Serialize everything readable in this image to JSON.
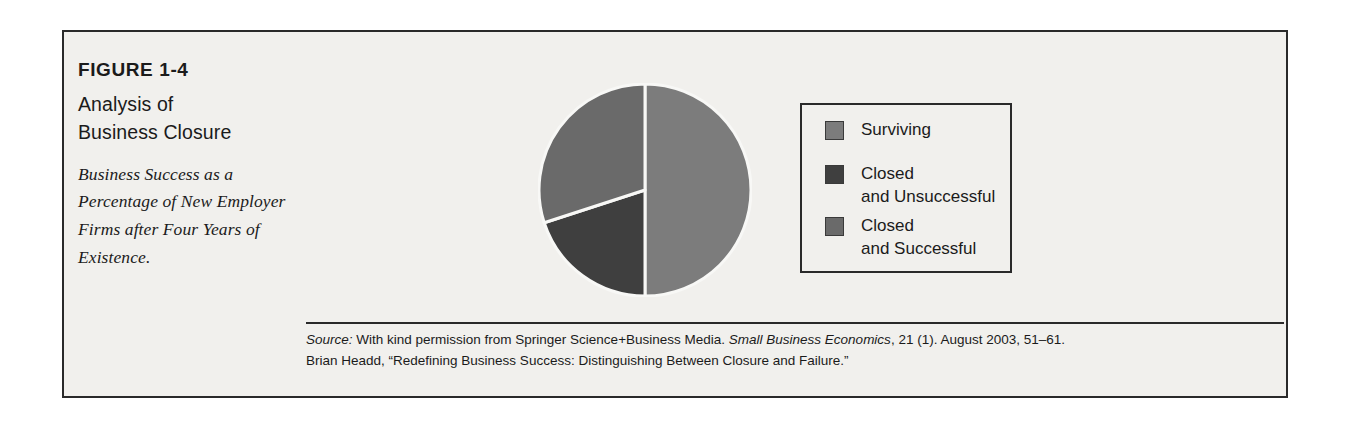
{
  "figure": {
    "number": "FIGURE 1-4",
    "title_lines": [
      "Analysis of",
      "Business Closure"
    ],
    "subtitle": "Business Success as a Percentage of New Employer Firms after Four Years of Existence."
  },
  "legend": {
    "items": [
      {
        "label": "Surviving",
        "color": "#7c7c7c",
        "swatch_name": "legend-swatch-surviving"
      },
      {
        "label": "Closed\nand Unsuccessful",
        "color": "#3f3f3f",
        "swatch_name": "legend-swatch-closed-unsuccessful"
      },
      {
        "label": "Closed\nand Successful",
        "color": "#6a6a6a",
        "swatch_name": "legend-swatch-closed-successful"
      }
    ]
  },
  "source": {
    "prefix": "Source:",
    "line1_a": " With kind permission from Springer Science+Business Media. ",
    "line1_italic": "Small Business Economics",
    "line1_b": ", 21 (1). August 2003, 51–61.",
    "line2": "Brian Headd, “Redefining Business Success: Distinguishing Between Closure and Failure.”"
  },
  "colors": {
    "page_background": "#ffffff",
    "panel_background": "#f1f0ed",
    "frame_border": "#2a2a2a",
    "text": "#1b1b1b",
    "wedge_divider": "#f8f8f6"
  },
  "chart_data": {
    "type": "pie",
    "title": "Analysis of Business Closure",
    "subtitle": "Business Success as a Percentage of New Employer Firms after Four Years of Existence.",
    "unit": "percent",
    "start_angle_deg": 0,
    "direction": "clockwise",
    "categories": [
      "Surviving",
      "Closed and Unsuccessful",
      "Closed and Successful"
    ],
    "values": [
      50,
      20,
      30
    ],
    "colors": [
      "#7c7c7c",
      "#3f3f3f",
      "#6a6a6a"
    ],
    "legend_position": "right",
    "grid": false,
    "slices": [
      {
        "label": "Surviving",
        "value": 50,
        "color": "#7c7c7c",
        "start_deg": 0,
        "end_deg": 180
      },
      {
        "label": "Closed and Unsuccessful",
        "value": 20,
        "color": "#3f3f3f",
        "start_deg": 180,
        "end_deg": 252
      },
      {
        "label": "Closed and Successful",
        "value": 30,
        "color": "#6a6a6a",
        "start_deg": 252,
        "end_deg": 360
      }
    ]
  }
}
